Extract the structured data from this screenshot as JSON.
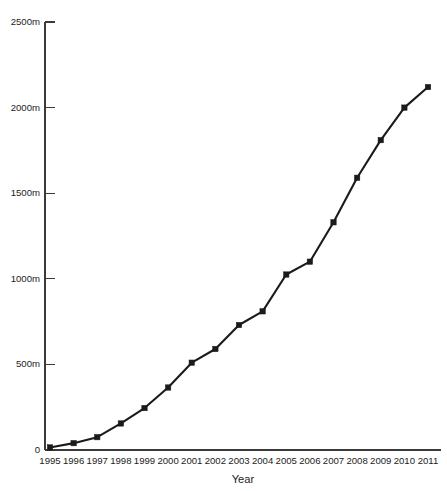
{
  "chart_data": {
    "type": "line",
    "title": "",
    "xlabel": "Year",
    "ylabel": "",
    "categories": [
      "1995",
      "1996",
      "1997",
      "1998",
      "1999",
      "2000",
      "2001",
      "2002",
      "2003",
      "2004",
      "2005",
      "2006",
      "2007",
      "2008",
      "2009",
      "2010",
      "2011"
    ],
    "x": [
      1995,
      1996,
      1997,
      1998,
      1999,
      2000,
      2001,
      2002,
      2003,
      2004,
      2005,
      2006,
      2007,
      2008,
      2009,
      2010,
      2011
    ],
    "values": [
      15,
      40,
      75,
      155,
      245,
      365,
      510,
      590,
      730,
      810,
      1025,
      1100,
      1330,
      1590,
      1810,
      2000,
      2120
    ],
    "series": [
      {
        "name": "",
        "values": [
          15,
          40,
          75,
          155,
          245,
          365,
          510,
          590,
          730,
          810,
          1025,
          1100,
          1330,
          1590,
          1810,
          2000,
          2120
        ]
      }
    ],
    "ylim": [
      0,
      2500
    ],
    "xlim": [
      1995,
      2011
    ],
    "yticks": [
      0,
      500,
      1000,
      1500,
      2000,
      2500
    ],
    "ytick_labels": [
      "0",
      "500m",
      "1000m",
      "1500m",
      "2000m",
      "2500m"
    ],
    "xtick_labels": [
      "1995",
      "1996",
      "1997",
      "1998",
      "1999",
      "2000",
      "2001",
      "2002",
      "2003",
      "2004",
      "2005",
      "2006",
      "2007",
      "2008",
      "2009",
      "2010",
      "2011"
    ],
    "grid": false,
    "legend": false,
    "legend_position": "none",
    "marker": "square",
    "line_color": "#1b1b1b",
    "marker_color": "#1b1b1b",
    "axis_color": "#3a3a3a",
    "background_color": "#ffffff"
  },
  "axes": {
    "x_axis_title": "Year"
  }
}
